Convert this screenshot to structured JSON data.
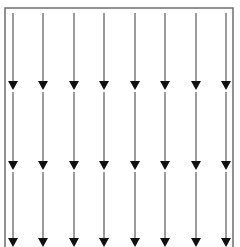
{
  "diagram": {
    "type": "flow-field",
    "width": 240,
    "height": 247,
    "colors": {
      "background": "#ffffff",
      "frame": "#6e6e6e",
      "line": "#7a7a7a",
      "arrowhead": "#111111"
    },
    "frame": {
      "left_x": 5,
      "right_x": 233,
      "top_y": 8,
      "bottom_y": 247
    },
    "columns_x": [
      13,
      43,
      74,
      104,
      135,
      165,
      196,
      226
    ],
    "segments": [
      {
        "start_y": 13,
        "tip_y": 90
      },
      {
        "start_y": 92,
        "tip_y": 170
      },
      {
        "start_y": 172,
        "tip_y": 247
      }
    ],
    "arrow_direction": "down",
    "arrowhead": {
      "half_width": 5,
      "height": 9
    }
  }
}
